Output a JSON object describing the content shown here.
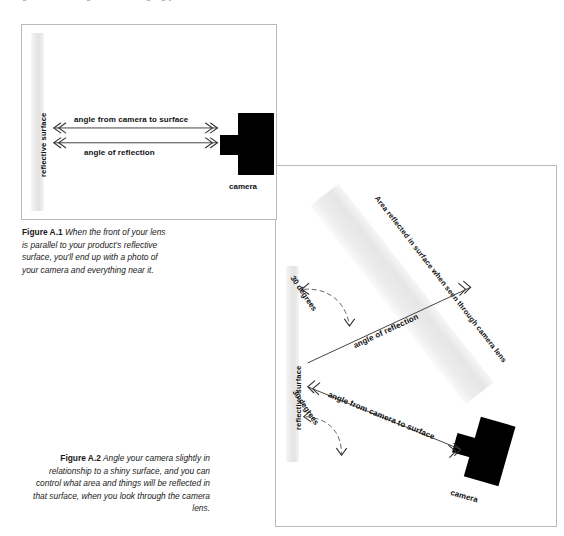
{
  "page": {
    "running_head": "Figure A.1 and Figure A.2 — angling your camera to control reflections"
  },
  "figure_a1": {
    "surface_label": "reflective surface",
    "camera_label": "camera",
    "arrow_top_label": "angle from camera to surface",
    "arrow_bottom_label": "angle of reflection",
    "caption_number": "Figure A.1",
    "caption_text": "When the front of your lens is parallel to your product's reflective surface, you'll end up with a photo of your camera and everything near it."
  },
  "figure_a2": {
    "surface_label": "reflective surface",
    "camera_label": "camera",
    "reflected_band_label": "Area reflected in surface when seen through camera lens",
    "arrow_reflection_label": "angle of reflection",
    "arrow_camera_to_surface_label": "angle from camera to surface",
    "degrees_top_label": "30 degrees",
    "degrees_bottom_label": "30 degrees",
    "caption_number": "Figure A.2",
    "caption_text": "Angle your camera slightly in relationship to a shiny surface, and you can control what area and things will be reflected in that surface, when you look through the camera lens."
  },
  "colors": {
    "panel_border": "#b9b9b9",
    "surface_band": "#e8e8e8",
    "camera_fill": "#000000",
    "arrow_stroke": "#444444",
    "text": "#111111"
  }
}
